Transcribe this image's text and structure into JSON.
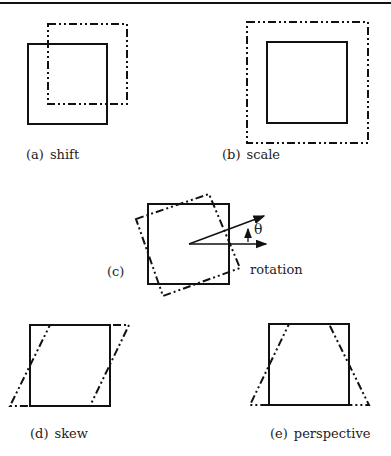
{
  "figure": {
    "panels": [
      {
        "id": "a",
        "tag": "(a)",
        "name": "shift"
      },
      {
        "id": "b",
        "tag": "(b)",
        "name": "scale"
      },
      {
        "id": "c",
        "tag": "(c)",
        "name": "rotation",
        "angle_symbol": "θ"
      },
      {
        "id": "d",
        "tag": "(d)",
        "name": "skew"
      },
      {
        "id": "e",
        "tag": "(e)",
        "name": "perspective"
      }
    ],
    "legend": {
      "solid": "original square",
      "dashdot": "transformed shape"
    }
  }
}
